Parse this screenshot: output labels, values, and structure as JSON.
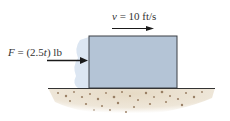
{
  "diagram": {
    "force_label": {
      "var": "F",
      "eq": " = (2.5",
      "t": "t",
      "unit": ") lb"
    },
    "velocity_label": {
      "var": "v",
      "eq": " = 10 ft/s"
    },
    "colors": {
      "block_fill": "#b4c4d6",
      "block_stroke": "#3a3f45",
      "shadow": "#dce6f2",
      "ground_line": "#333333",
      "soil": "#e3d7c2",
      "pebbles": "#8c6f52",
      "arrow": "#1a1a1a"
    }
  }
}
